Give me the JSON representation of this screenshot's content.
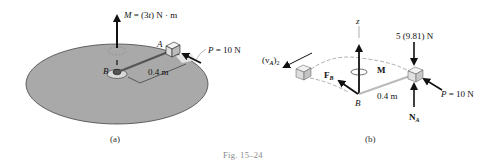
{
  "figure": {
    "caption": "Fig. 15–24",
    "colors": {
      "disk_fill": "#a9a9a9",
      "disk_stroke": "#444444",
      "arrow": "#111111",
      "dashed_path": "#9a9a9a",
      "rod": "#9c9c9c",
      "block_face": "#eeeeee"
    }
  },
  "panel_a": {
    "label": "(a)",
    "moment_label_var": "M",
    "moment_label_rest": " = (3",
    "moment_label_t": "t",
    "moment_label_end": ") N · m",
    "point_A": "A",
    "point_B": "B",
    "force_label_var": "P",
    "force_label_rest": " = 10 N",
    "length_label": "0.4 m"
  },
  "panel_b": {
    "label": "(b)",
    "axis_z": "z",
    "weight_label": "5 (9.81) N",
    "moment_label": "M",
    "velocity_label": "(v",
    "velocity_sub_A": "A",
    "velocity_close": ")",
    "velocity_sub_2": "2",
    "force_B_label": "F",
    "force_B_sub": "B",
    "point_B": "B",
    "length_label": "0.4 m",
    "force_label_var": "P",
    "force_label_rest": " = 10 N",
    "normal_label": "N",
    "normal_sub": "A"
  }
}
